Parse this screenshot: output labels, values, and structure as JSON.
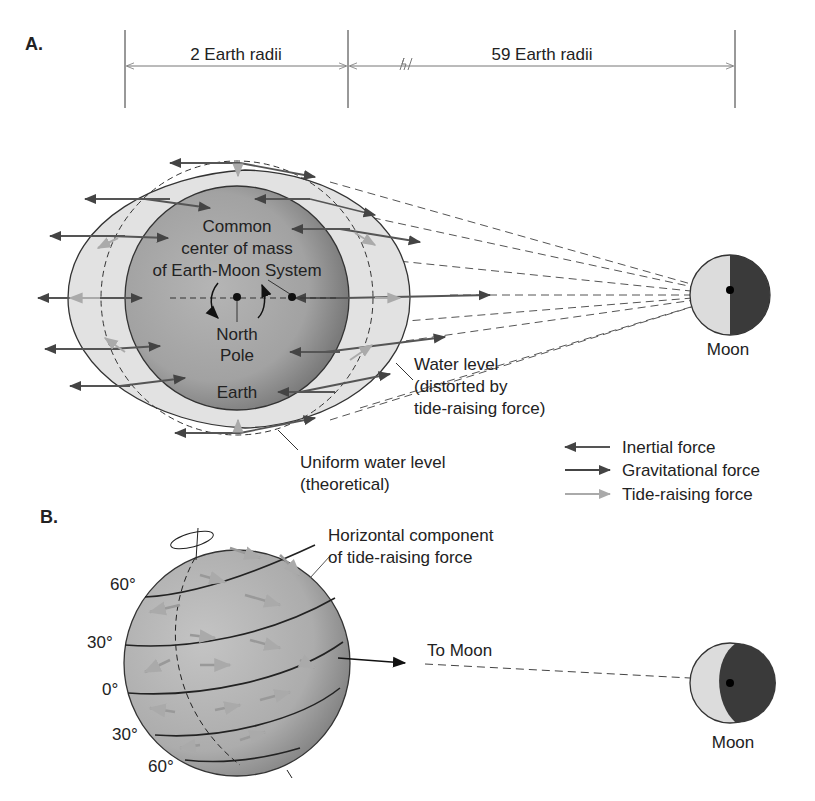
{
  "panel_a": {
    "label": "A.",
    "dim_left": "2 Earth radii",
    "dim_right": "59 Earth radii",
    "center_label_1": "Common",
    "center_label_2": "center of mass",
    "center_label_3": "of Earth-Moon System",
    "north_label_1": "North",
    "north_label_2": "Pole",
    "earth_label": "Earth",
    "moon_label": "Moon",
    "water_1": "Water level",
    "water_2": "(distorted by",
    "water_3": "tide-raising force)",
    "uniform_1": "Uniform water level",
    "uniform_2": "(theoretical)"
  },
  "legend": {
    "items": [
      {
        "label": "Inertial force",
        "color": "#555555",
        "direction": "left"
      },
      {
        "label": "Gravitational force",
        "color": "#444444",
        "direction": "right"
      },
      {
        "label": "Tide-raising force",
        "color": "#aaaaaa",
        "direction": "right"
      }
    ]
  },
  "panel_b": {
    "label": "B.",
    "horiz_1": "Horizontal component",
    "horiz_2": "of tide-raising force",
    "to_moon": "To Moon",
    "moon_label": "Moon",
    "latitudes": [
      "60°",
      "30°",
      "0°",
      "30°",
      "60°"
    ]
  },
  "colors": {
    "earth_fill": "#9a9a9a",
    "water_fill": "#e2e2e2",
    "moon_light": "#dcdcdc",
    "moon_dark": "#3a3a3a",
    "line": "#333333"
  }
}
